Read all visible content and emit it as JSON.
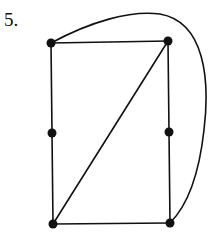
{
  "problem": {
    "label": "5."
  },
  "graph": {
    "vertices": [
      {
        "id": "top-left",
        "x": 51,
        "y": 43
      },
      {
        "id": "top-right",
        "x": 168,
        "y": 41
      },
      {
        "id": "mid-left",
        "x": 52,
        "y": 133
      },
      {
        "id": "mid-right",
        "x": 169,
        "y": 132
      },
      {
        "id": "bottom-left",
        "x": 53,
        "y": 224
      },
      {
        "id": "bottom-right",
        "x": 170,
        "y": 223
      }
    ],
    "edges": [
      [
        "top-left",
        "top-right"
      ],
      [
        "top-left",
        "mid-left"
      ],
      [
        "mid-left",
        "bottom-left"
      ],
      [
        "top-right",
        "mid-right"
      ],
      [
        "mid-right",
        "bottom-right"
      ],
      [
        "bottom-left",
        "bottom-right"
      ],
      [
        "top-right",
        "bottom-left"
      ],
      [
        "top-left",
        "bottom-right",
        "curved"
      ]
    ],
    "stroke_color": "#111111"
  }
}
